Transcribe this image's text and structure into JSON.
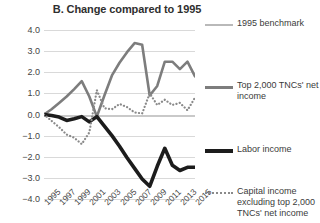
{
  "chart_data": {
    "type": "line",
    "title": "B. Change compared to 1995",
    "xlabel": "",
    "ylabel": "Percentage of world gross product",
    "ylim": [
      -4.0,
      4.0
    ],
    "yticks": [
      "4.0",
      "3.0",
      "2.0",
      "1.0",
      "0.0",
      "−1.0",
      "−2.0",
      "−3.0",
      "−4.0"
    ],
    "ytick_values": [
      4.0,
      3.0,
      2.0,
      1.0,
      0.0,
      -1.0,
      -2.0,
      -3.0,
      -4.0
    ],
    "grid": true,
    "legend_position": "right",
    "x": [
      1995,
      1996,
      1997,
      1998,
      1999,
      2000,
      2001,
      2002,
      2003,
      2004,
      2005,
      2006,
      2007,
      2008,
      2009,
      2010,
      2011,
      2012,
      2013,
      2014,
      2015
    ],
    "xtick_labels": [
      "1995",
      "1997",
      "1999",
      "2001",
      "2003",
      "2005",
      "2007",
      "2009",
      "2011",
      "2013",
      "2015"
    ],
    "xtick_values": [
      1995,
      1997,
      1999,
      2001,
      2003,
      2005,
      2007,
      2009,
      2011,
      2013,
      2015
    ],
    "series": [
      {
        "name": "1995 benchmark",
        "style": "solid-light",
        "color": "#b9b9b9",
        "values": [
          0.0,
          0.0,
          0.0,
          0.0,
          0.0,
          0.0,
          0.0,
          0.0,
          0.0,
          0.0,
          0.0,
          0.0,
          0.0,
          0.0,
          0.0,
          0.0,
          0.0,
          0.0,
          0.0,
          0.0,
          0.0
        ]
      },
      {
        "name": "Top 2,000 TNCs' net income",
        "style": "solid-medium",
        "color": "#7d7d7d",
        "values": [
          0.0,
          0.25,
          0.55,
          0.85,
          1.2,
          1.58,
          0.85,
          -0.1,
          0.9,
          1.85,
          2.45,
          2.95,
          3.38,
          3.3,
          0.9,
          1.35,
          2.5,
          2.5,
          2.15,
          2.5,
          1.8
        ]
      },
      {
        "name": "Labor income",
        "style": "solid-bold",
        "color": "#1c1c1c",
        "values": [
          0.0,
          -0.05,
          -0.12,
          -0.28,
          -0.2,
          -0.1,
          -0.35,
          -0.1,
          -0.55,
          -1.0,
          -1.5,
          -2.05,
          -2.55,
          -3.05,
          -3.4,
          -2.45,
          -1.6,
          -2.4,
          -2.65,
          -2.5,
          -2.5
        ]
      },
      {
        "name": "Capital income excluding top 2,000 TNCs' net income",
        "style": "dotted",
        "color": "#8a8a8a",
        "values": [
          0.0,
          -0.3,
          -0.6,
          -0.95,
          -1.1,
          -1.4,
          -0.85,
          1.15,
          0.3,
          0.25,
          0.5,
          0.35,
          0.1,
          0.05,
          1.0,
          0.45,
          0.7,
          0.45,
          0.55,
          0.2,
          0.8
        ]
      }
    ]
  }
}
